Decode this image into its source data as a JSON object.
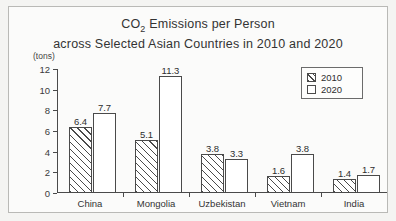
{
  "figure": {
    "title_line_1_pre": "CO",
    "title_line_1_sub": "2",
    "title_line_1_post": " Emissions per Person",
    "title_line_2": "across Selected Asian Countries in 2010 and 2020",
    "unit_label": "(tons)"
  },
  "legend": {
    "position": "top-right",
    "entries": [
      {
        "label": "2010",
        "pattern": "diagonal-hatch"
      },
      {
        "label": "2020",
        "pattern": "empty"
      }
    ]
  },
  "chart_data": {
    "type": "bar",
    "title": "CO2 Emissions per Person across Selected Asian Countries in 2010 and 2020",
    "xlabel": "",
    "ylabel": "(tons)",
    "ylim": [
      0,
      12
    ],
    "yticks": [
      0,
      2,
      4,
      6,
      8,
      10,
      12
    ],
    "ytick_labels": [
      "0",
      "2",
      "4",
      "6",
      "8",
      "10",
      "12"
    ],
    "grid": false,
    "categories": [
      "China",
      "Mongolia",
      "Uzbekistan",
      "Vietnam",
      "India"
    ],
    "series": [
      {
        "name": "2010",
        "values": [
          6.4,
          5.1,
          3.8,
          1.6,
          1.4
        ]
      },
      {
        "name": "2020",
        "values": [
          7.7,
          11.3,
          3.3,
          3.8,
          1.7
        ]
      }
    ],
    "value_labels": {
      "China": [
        "6.4",
        "7.7"
      ],
      "Mongolia": [
        "5.1",
        "11.3"
      ],
      "Uzbekistan": [
        "3.8",
        "3.3"
      ],
      "Vietnam": [
        "1.6",
        "3.8"
      ],
      "India": [
        "1.4",
        "1.7"
      ]
    }
  },
  "colors": {
    "axis": "#4a4a4a",
    "bar_outline": "#4a4a4a",
    "bar_fill_2020": "#ffffff",
    "background": "#fbfbfa"
  }
}
